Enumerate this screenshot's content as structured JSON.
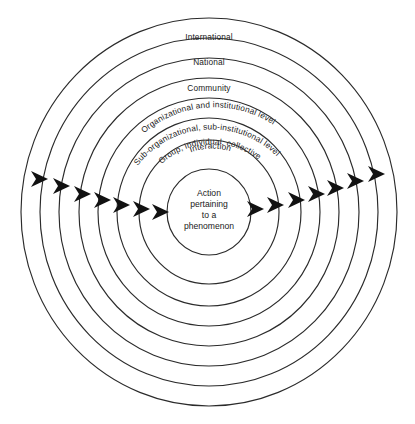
{
  "diagram": {
    "type": "concentric-circles",
    "background_color": "#ffffff",
    "line_color": "#2b2b2b",
    "arrow_color": "#111111",
    "text_color": "#1a1a1a",
    "rings": [
      {
        "id": "ring-international",
        "label": "International",
        "index": 1,
        "label_style": "straight"
      },
      {
        "id": "ring-national",
        "label": "National",
        "index": 2,
        "label_style": "straight"
      },
      {
        "id": "ring-community",
        "label": "Community",
        "index": 3,
        "label_style": "straight"
      },
      {
        "id": "ring-organizational",
        "label": "Organizational and institutional level",
        "index": 4,
        "label_style": "curved"
      },
      {
        "id": "ring-sub-organizational",
        "label": "Sub-organizational, sub-institutional level",
        "index": 5,
        "label_style": "curved"
      },
      {
        "id": "ring-group",
        "label": "Group, individual, collective",
        "index": 6,
        "label_style": "curved"
      },
      {
        "id": "ring-interaction",
        "label": "Interaction",
        "index": 7,
        "label_style": "curved"
      }
    ],
    "core": {
      "id": "core-action",
      "lines": [
        "Action",
        "pertaining",
        "to a",
        "phenomenon"
      ]
    },
    "arrows": {
      "count_left": 7,
      "count_right": 7,
      "direction": "rightward-through-each-boundary"
    }
  }
}
